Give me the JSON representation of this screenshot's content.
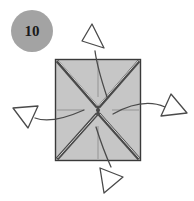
{
  "figure": {
    "step_badge": {
      "label": "10",
      "shape": "circle",
      "fill_color": "#a3a3a3",
      "text_color": "#1a1a1a",
      "center_x": 32,
      "center_y": 31,
      "radius": 21
    },
    "paper": {
      "name": "square-sheet",
      "fill_color": "#c6c6c6",
      "stroke_color": "#3a3a3a",
      "left": 55,
      "top": 59,
      "width": 86,
      "height": 102
    },
    "creases": {
      "mountain_color": "#4a4a4a",
      "reference_color": "#8f8f8f",
      "diagonals": [
        {
          "name": "crease-diagonal-tl-br",
          "x1": 56,
          "y1": 60,
          "x2": 140,
          "y2": 160
        },
        {
          "name": "crease-diagonal-tr-bl",
          "x1": 140,
          "y1": 60,
          "x2": 56,
          "y2": 160
        }
      ],
      "reference_lines": [
        {
          "name": "crease-reference-vertical",
          "x1": 98,
          "y1": 60,
          "x2": 98,
          "y2": 160
        },
        {
          "name": "crease-reference-horizontal",
          "x1": 56,
          "y1": 110,
          "x2": 140,
          "y2": 110
        }
      ]
    },
    "arrows": {
      "stroke_color": "#4a4a4a",
      "head_fill": "#ffffff",
      "items": [
        {
          "name": "arrow-fold-up",
          "direction": "up",
          "tail_path": "M 106 96 C 101 80 96 64 94 50",
          "head_points": "94,24 107,46 84,42",
          "head_rotation": -18
        },
        {
          "name": "arrow-fold-right",
          "direction": "right",
          "tail_path": "M 112 114 C 130 104 148 100 164 106",
          "head_points": "186,113 162,115 172,95",
          "head_rotation": 14
        },
        {
          "name": "arrow-fold-left",
          "direction": "left",
          "tail_path": "M 84 110 C 66 118 48 122 34 117",
          "head_points": "12,110 36,108 27,128",
          "head_rotation": -12
        },
        {
          "name": "arrow-fold-down",
          "direction": "down",
          "tail_path": "M 96 126 C 101 142 106 155 110 166",
          "head_points": "104,192 102,168 124,176",
          "head_rotation": 10
        }
      ]
    }
  }
}
